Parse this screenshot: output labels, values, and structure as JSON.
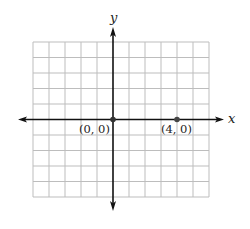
{
  "diagram": {
    "type": "coordinate-plane",
    "axes": {
      "x_label": "x",
      "y_label": "y"
    },
    "grid": {
      "columns": 11,
      "rows": 10,
      "x_min": -5,
      "x_max": 6,
      "y_min": -5,
      "y_max": 5,
      "line_color": "#b8b8b8",
      "axis_color": "#111111"
    },
    "points": [
      {
        "x": 0,
        "y": 0,
        "label": "(0, 0)"
      },
      {
        "x": 4,
        "y": 0,
        "label": "(4, 0)"
      }
    ]
  }
}
